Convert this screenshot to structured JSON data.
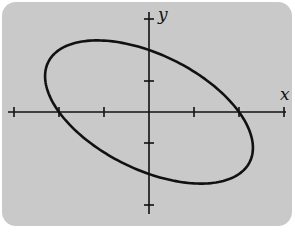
{
  "figure": {
    "background_color": "#c9c9c9",
    "line_color": "#111111",
    "x_axis_label": "x",
    "y_axis_label": "y",
    "curve_equation": "x^2 + xy + y^2 = 4"
  },
  "chart_data": {
    "type": "line",
    "title": "",
    "xlabel": "x",
    "ylabel": "y",
    "curve": "ellipse",
    "equation": "x^2 + xy + y^2 = 4",
    "x_intercepts": [
      -2,
      2
    ],
    "y_intercepts": [
      -2,
      2
    ],
    "x_ticks": [
      -3,
      -2,
      -1,
      1,
      2,
      3
    ],
    "y_ticks": [
      -3,
      -1,
      1,
      3
    ],
    "xlim": [
      -3.1,
      3.1
    ],
    "ylim": [
      -3.2,
      3.2
    ],
    "extremes": {
      "max_x": [
        2.31,
        -1.15
      ],
      "min_x": [
        -2.31,
        1.15
      ],
      "max_y": [
        -1.15,
        2.31
      ],
      "min_y": [
        1.15,
        -2.31
      ]
    },
    "grid": false,
    "tick_labels_shown": false
  }
}
